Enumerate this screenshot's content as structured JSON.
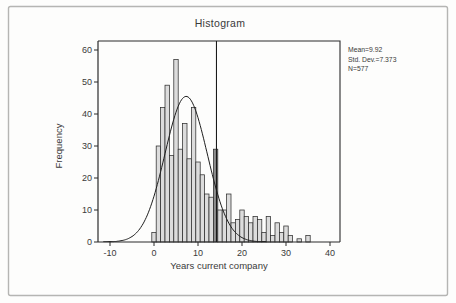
{
  "figure": {
    "title": "Histogram",
    "x_axis_label": "Years current company",
    "y_axis_label": "Frequency",
    "stats": {
      "mean": "Mean=9.92",
      "std_dev": "Std. Dev.=7.373",
      "n": "N=577"
    }
  },
  "chart_data": {
    "type": "bar",
    "subtype": "histogram with normal curve overlay",
    "title": "Histogram",
    "xlabel": "Years current company",
    "ylabel": "Frequency",
    "xlim": [
      -12.7,
      42.3
    ],
    "ylim": [
      0,
      62
    ],
    "x_ticks": [
      -10,
      0,
      10,
      20,
      30,
      40
    ],
    "y_ticks": [
      0,
      10,
      20,
      30,
      40,
      50,
      60
    ],
    "grid": false,
    "bin_width": 1,
    "years": [
      0,
      1,
      2,
      3,
      4,
      5,
      6,
      7,
      8,
      9,
      10,
      11,
      12,
      13,
      14,
      15,
      16,
      17,
      18,
      19,
      20,
      21,
      22,
      23,
      24,
      25,
      26,
      27,
      28,
      29,
      30,
      31,
      32,
      33,
      34,
      35
    ],
    "frequencies": [
      3,
      30,
      42,
      49,
      27,
      57,
      29,
      37,
      26,
      42,
      25,
      21,
      15,
      14,
      29,
      10,
      10,
      15,
      6,
      7,
      10,
      8,
      6,
      8,
      7,
      3,
      8,
      2,
      6,
      3,
      5,
      2,
      0,
      1,
      0,
      2
    ],
    "highlighted_year": 14,
    "reference_line_x": 14.2,
    "normal_curve": {
      "peak": 45.5,
      "center": 7.3,
      "sigma": 4.8,
      "x_start": -11.5,
      "x_end": 25.5
    },
    "stats_annotation": [
      "Mean=9.92",
      "Std. Dev.=7.373",
      "N=577"
    ],
    "legend": "none",
    "colors": {
      "bar_fill": "#dcdcdc",
      "bar_highlight_fill": "#8e8e8e",
      "bar_stroke": "#2e2e2e",
      "curve": "#1f1f1f",
      "axis": "#2b2b2b",
      "frame": "#b5b5b3",
      "text": "#3a3a3a"
    }
  }
}
